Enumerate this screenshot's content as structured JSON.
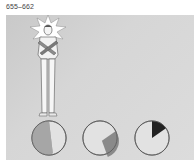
{
  "caption": {
    "range_label": "655–662"
  },
  "illustration": {
    "subject": "man-with-crossed-arms-and-starburst",
    "colors": {
      "background": "#d4d4d4",
      "starburst": "#ffffff",
      "figure_fill": "#f4f4f4",
      "arms_x": "#8c8c8c",
      "outline": "#555555"
    }
  },
  "pies": [
    {
      "id": "pie-1",
      "filled_fraction": 0.45,
      "fill_color": "#a6a6a6",
      "start_deg": 180,
      "end_deg": 360,
      "note": "left half filled"
    },
    {
      "id": "pie-2",
      "filled_fraction": 0.25,
      "fill_color": "#8a8a8a",
      "start_deg": 55,
      "end_deg": 160,
      "note": "wedge on right side"
    },
    {
      "id": "pie-3",
      "filled_fraction": 0.12,
      "fill_color": "#222222",
      "start_deg": 0,
      "end_deg": 55,
      "note": "small dark wedge at top"
    }
  ]
}
